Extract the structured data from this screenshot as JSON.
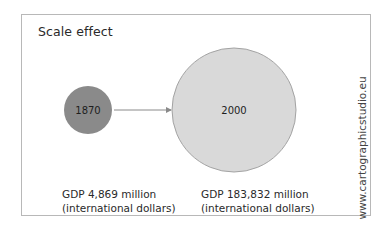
{
  "title": "Scale effect",
  "credit": "www.cartographicstudio.eu",
  "colors": {
    "small_circle_fill": "#8a8a8a",
    "large_circle_fill": "#d9d9d9",
    "large_circle_stroke": "#a3a3a3",
    "arrow": "#8a8a8a",
    "frame": "#b8b8b8"
  },
  "circles": [
    {
      "year": "1870",
      "gdp_line1": "GDP 4,869 million",
      "gdp_line2": "(international dollars)",
      "value_million": 4869
    },
    {
      "year": "2000",
      "gdp_line1": "GDP 183,832 million",
      "gdp_line2": "(international dollars)",
      "value_million": 183832
    }
  ]
}
